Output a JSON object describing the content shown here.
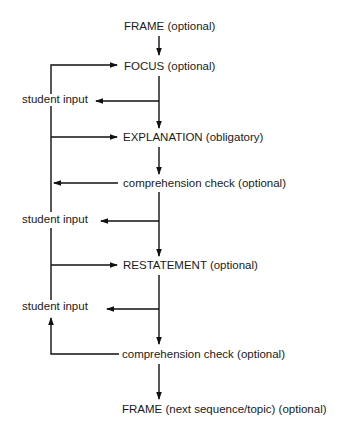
{
  "diagram": {
    "top_cut_text": "",
    "nodes": {
      "frame_start": "FRAME (optional)",
      "focus": "FOCUS (optional)",
      "student_input_1": "student input",
      "explanation": "EXPLANATION (obligatory)",
      "comprehension_check_1": "comprehension check (optional)",
      "student_input_2": "student input",
      "restatement": "RESTATEMENT (optional)",
      "student_input_3": "student input",
      "comprehension_check_2": "comprehension check (optional)",
      "frame_end": "FRAME (next sequence/topic) (optional)"
    },
    "edges": [
      {
        "from": "frame_start",
        "to": "focus"
      },
      {
        "from": "focus",
        "to": "explanation"
      },
      {
        "from": "focus",
        "to": "student_input_1"
      },
      {
        "from": "student_input_1",
        "to": "focus"
      },
      {
        "from": "student_input_1",
        "to": "explanation"
      },
      {
        "from": "explanation",
        "to": "comprehension_check_1"
      },
      {
        "from": "comprehension_check_1",
        "to": "student_input_1"
      },
      {
        "from": "comprehension_check_1",
        "to": "restatement"
      },
      {
        "from": "comprehension_check_1",
        "to": "student_input_2"
      },
      {
        "from": "student_input_2",
        "to": "restatement"
      },
      {
        "from": "restatement",
        "to": "comprehension_check_2"
      },
      {
        "from": "restatement",
        "to": "student_input_3"
      },
      {
        "from": "comprehension_check_2",
        "to": "student_input_3"
      },
      {
        "from": "comprehension_check_2",
        "to": "frame_end"
      }
    ],
    "line_color": "#111111",
    "text_color": "#1a1a1a"
  }
}
